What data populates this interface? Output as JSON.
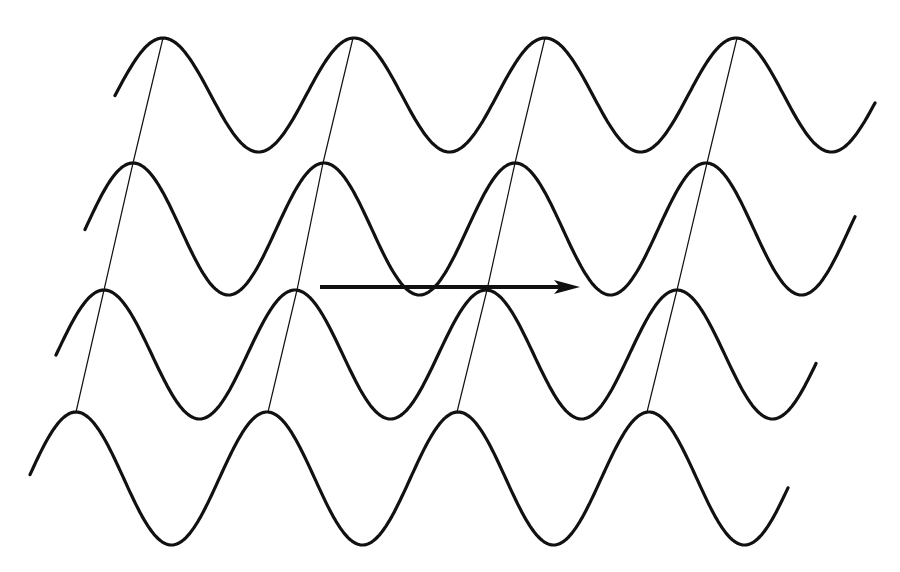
{
  "diagram": {
    "title": "",
    "background": "#ffffff",
    "stroke_color": "#111111",
    "waves": [
      {
        "id": "wave-1",
        "x_start": 115,
        "x_end": 876,
        "peak_y": 38,
        "trough_y": 152,
        "first_peak_x": 163,
        "period": 191
      },
      {
        "id": "wave-2",
        "x_start": 85,
        "x_end": 856,
        "peak_y": 163,
        "trough_y": 295,
        "first_peak_x": 133,
        "period": 191
      },
      {
        "id": "wave-3",
        "x_start": 56,
        "x_end": 816,
        "peak_y": 290,
        "trough_y": 419,
        "first_peak_x": 104,
        "period": 191
      },
      {
        "id": "wave-4",
        "x_start": 30,
        "x_end": 788,
        "peak_y": 412,
        "trough_y": 545,
        "first_peak_x": 76,
        "period": 191
      }
    ],
    "wavefront_lines": [
      {
        "id": "wavefront-1",
        "points": [
          [
            163,
            38
          ],
          [
            133,
            163
          ],
          [
            104,
            290
          ],
          [
            76,
            412
          ]
        ]
      },
      {
        "id": "wavefront-2",
        "points": [
          [
            353,
            38
          ],
          [
            323,
            163
          ],
          [
            297,
            290
          ],
          [
            268,
            412
          ]
        ]
      },
      {
        "id": "wavefront-3",
        "points": [
          [
            545,
            38
          ],
          [
            515,
            163
          ],
          [
            487,
            290
          ],
          [
            457,
            412
          ]
        ]
      },
      {
        "id": "wavefront-4",
        "points": [
          [
            737,
            38
          ],
          [
            707,
            163
          ],
          [
            677,
            290
          ],
          [
            647,
            412
          ]
        ]
      }
    ],
    "arrow": {
      "x1": 320,
      "y1": 287,
      "x2": 580,
      "y2": 287,
      "direction": "right"
    }
  }
}
